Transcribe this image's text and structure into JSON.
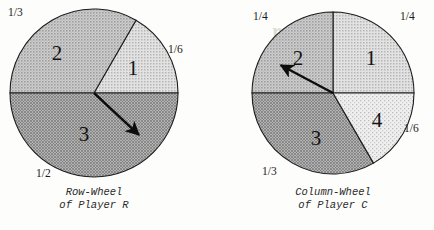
{
  "page": {
    "background_color": "#fdfdfb",
    "bleed_text": "rategy) Ga",
    "bleed_color": "#dcdcd6"
  },
  "figure": {
    "title": "",
    "wheels": [
      {
        "id": "row-wheel",
        "caption_line1": "Row-Wheel",
        "caption_line2": "of Player R",
        "center_x": 94,
        "center_y": 93,
        "radius": 84,
        "pointer_angle_deg": 43,
        "pointer_label": "spinner-arrow",
        "sectors": [
          {
            "number": "1",
            "fraction": "1/6",
            "start_deg": -60,
            "end_deg": 0,
            "fill": "#d9d9d9",
            "pattern": "light-dot",
            "label_x": 133,
            "label_y": 70
          },
          {
            "number": "2",
            "fraction": "1/3",
            "start_deg": -180,
            "end_deg": -60,
            "fill": "#c0c0c0",
            "pattern": "mid-dot",
            "label_x": 57,
            "label_y": 55
          },
          {
            "number": "3",
            "fraction": "1/2",
            "start_deg": 0,
            "end_deg": 180,
            "fill": "#a8a8a8",
            "pattern": "dark-dot",
            "label_x": 84,
            "label_y": 136
          }
        ],
        "fraction_labels": [
          {
            "text": "1/3",
            "x": 8,
            "y": 6
          },
          {
            "text": "1/6",
            "x": 168,
            "y": 43
          },
          {
            "text": "1/2",
            "x": 36,
            "y": 167
          }
        ]
      },
      {
        "id": "column-wheel",
        "caption_line1": "Column-Wheel",
        "caption_line2": "of Player C",
        "center_x": 333,
        "center_y": 93,
        "radius": 81,
        "pointer_angle_deg": 208,
        "pointer_label": "spinner-arrow",
        "sectors": [
          {
            "number": "1",
            "fraction": "1/4",
            "start_deg": -90,
            "end_deg": 0,
            "fill": "#d9d9d9",
            "pattern": "light-dot",
            "label_x": 371,
            "label_y": 60
          },
          {
            "number": "2",
            "fraction": "1/4",
            "start_deg": 180,
            "end_deg": 270,
            "fill": "#c0c0c0",
            "pattern": "mid-dot",
            "label_x": 298,
            "label_y": 60
          },
          {
            "number": "3",
            "fraction": "1/3",
            "start_deg": 60,
            "end_deg": 180,
            "fill": "#a0a0a0",
            "pattern": "dark-dot",
            "label_x": 316,
            "label_y": 140
          },
          {
            "number": "4",
            "fraction": "1/6",
            "start_deg": 0,
            "end_deg": 60,
            "fill": "#e6e6e6",
            "pattern": "faint-dot",
            "label_x": 377,
            "label_y": 122
          }
        ],
        "fraction_labels": [
          {
            "text": "1/4",
            "x": 253,
            "y": 10
          },
          {
            "text": "1/4",
            "x": 400,
            "y": 10
          },
          {
            "text": "1/6",
            "x": 404,
            "y": 122
          },
          {
            "text": "1/3",
            "x": 262,
            "y": 165
          }
        ]
      }
    ]
  }
}
